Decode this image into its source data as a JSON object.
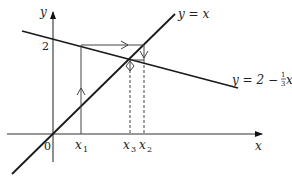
{
  "diagram": {
    "type": "cobweb-diagram",
    "axes": {
      "x_label": "x",
      "y_label": "y",
      "origin_label": "0",
      "y_tick_label": "2"
    },
    "lines": [
      {
        "name": "identity-line",
        "label": "y = x"
      },
      {
        "name": "iteration-function-line",
        "label_main": "y = 2 − ",
        "label_frac_num": "1",
        "label_frac_den": "3",
        "label_var": "x"
      }
    ],
    "x_points": [
      {
        "label": "x",
        "sub": "1"
      },
      {
        "label": "x",
        "sub": "3"
      },
      {
        "label": "x",
        "sub": "2"
      }
    ],
    "colors": {
      "line": "#1a1a1a",
      "axis": "#333333",
      "cobweb": "#444444"
    }
  }
}
